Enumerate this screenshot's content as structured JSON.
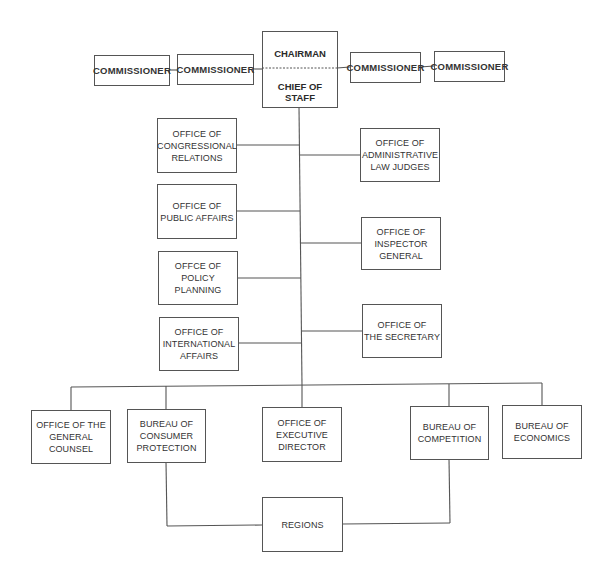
{
  "chart": {
    "type": "org-chart",
    "top": {
      "chairman": "CHAIRMAN",
      "chief_of_staff": "CHIEF OF STAFF"
    },
    "commissioners": [
      {
        "label": "COMMISSIONER"
      },
      {
        "label": "COMMISSIONER"
      },
      {
        "label": "COMMISSIONER"
      },
      {
        "label": "COMMISSIONER"
      }
    ],
    "left_offices": [
      {
        "label": "OFFICE OF\nCONGRESSIONAL\nRELATIONS"
      },
      {
        "label": "OFFICE OF\nPUBLIC AFFAIRS"
      },
      {
        "label": "OFFCE OF\nPOLICY PLANNING"
      },
      {
        "label": "OFFICE OF\nINTERNATIONAL\nAFFAIRS"
      }
    ],
    "right_offices": [
      {
        "label": "OFFICE OF\nADMINISTRATIVE\nLAW JUDGES"
      },
      {
        "label": "OFFICE OF\nINSPECTOR\nGENERAL"
      },
      {
        "label": "OFFICE OF\nTHE SECRETARY"
      }
    ],
    "bottom_units": [
      {
        "label": "OFFICE OF THE\nGENERAL COUNSEL"
      },
      {
        "label": "BUREAU OF\nCONSUMER\nPROTECTION"
      },
      {
        "label": "OFFICE OF\nEXECUTIVE\nDIRECTOR"
      },
      {
        "label": "BUREAU OF\nCOMPETITION"
      },
      {
        "label": "BUREAU OF\nECONOMICS"
      }
    ],
    "regions": {
      "label": "REGIONS"
    }
  }
}
